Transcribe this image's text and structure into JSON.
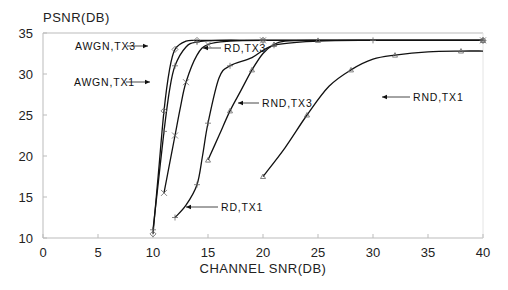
{
  "chart_data": {
    "type": "line",
    "title": "",
    "xlabel": "CHANNEL SNR(DB)",
    "ylabel": "PSNR(DB)",
    "xlim": [
      0,
      40
    ],
    "ylim": [
      10,
      35
    ],
    "xticks": [
      0,
      5,
      10,
      15,
      20,
      25,
      30,
      35,
      40
    ],
    "yticks": [
      10,
      15,
      20,
      25,
      30,
      35
    ],
    "grid": false,
    "legend_position": "inline annotations with leader lines",
    "series": [
      {
        "name": "AWGN,TX3",
        "x": [
          10,
          10.5,
          11,
          11.5,
          12,
          13,
          14,
          16,
          20,
          30,
          40
        ],
        "y": [
          10.5,
          18,
          25.5,
          30.5,
          33,
          34,
          34.1,
          34.1,
          34.1,
          34.1,
          34.1
        ],
        "marker": "diamond"
      },
      {
        "name": "AWGN,TX1",
        "x": [
          10,
          10.5,
          11,
          11.5,
          12,
          13,
          14,
          16,
          20,
          30,
          40
        ],
        "y": [
          11,
          17,
          23,
          28,
          31,
          33.3,
          33.9,
          34.1,
          34.1,
          34.1,
          34.1
        ],
        "marker": "plus"
      },
      {
        "name": "RD,TX3",
        "x": [
          11,
          11.5,
          12,
          12.5,
          13,
          14,
          15,
          17,
          20,
          30,
          40
        ],
        "y": [
          15.5,
          19,
          22.5,
          26,
          29,
          32.3,
          33.6,
          34,
          34.1,
          34.1,
          34.1
        ],
        "marker": "x"
      },
      {
        "name": "RD,TX1",
        "x": [
          12,
          13,
          14,
          14.5,
          15,
          16,
          17,
          19,
          21,
          25,
          30,
          40
        ],
        "y": [
          12.5,
          14,
          16.5,
          20,
          24,
          29.5,
          31,
          32,
          33.5,
          34,
          34.1,
          34.1
        ],
        "marker": "plus"
      },
      {
        "name": "RND,TX3",
        "x": [
          15,
          16,
          17,
          18,
          19,
          20,
          21,
          22,
          25,
          30,
          40
        ],
        "y": [
          19.5,
          22.5,
          25.5,
          28,
          30.5,
          32.5,
          33.6,
          34,
          34.1,
          34.1,
          34.1
        ],
        "marker": "triangle"
      },
      {
        "name": "RND,TX1",
        "x": [
          20,
          22,
          24,
          26,
          28,
          30,
          32,
          35,
          38,
          40
        ],
        "y": [
          17.5,
          21,
          25,
          28.5,
          30.5,
          31.8,
          32.3,
          32.7,
          32.8,
          32.8
        ],
        "marker": "triangle"
      }
    ],
    "annotations": [
      {
        "text": "AWGN,TX3",
        "target_series": "AWGN,TX3"
      },
      {
        "text": "AWGN,TX1",
        "target_series": "AWGN,TX1"
      },
      {
        "text": "RD,TX3",
        "target_series": "RD,TX3"
      },
      {
        "text": "RD,TX1",
        "target_series": "RD,TX1"
      },
      {
        "text": "RND,TX3",
        "target_series": "RND,TX3"
      },
      {
        "text": "RND,TX1",
        "target_series": "RND,TX1"
      }
    ]
  },
  "labels": {
    "ylabel": "PSNR(DB)",
    "xlabel": "CHANNEL SNR(DB)",
    "awgn_tx3": "AWGN,TX3",
    "awgn_tx1": "AWGN,TX1",
    "rd_tx3": "RD,TX3",
    "rd_tx1": "RD,TX1",
    "rnd_tx3": "RND,TX3",
    "rnd_tx1": "RND,TX1"
  },
  "colors": {
    "line": "#111111",
    "axis": "#bbbbbb",
    "text": "#222222"
  }
}
